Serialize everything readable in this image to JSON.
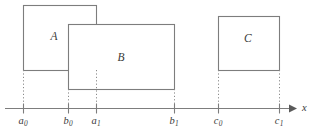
{
  "figure": {
    "width": 314,
    "height": 138,
    "background_color": "#ffffff",
    "stroke_color": "#7d7d7d",
    "text_color": "#3a3a3a",
    "dotted_color": "#8a8a8a"
  },
  "axis": {
    "name": "x",
    "y": 108,
    "start_x": 5,
    "end_x": 297,
    "name_x": 302,
    "tick_height": 5,
    "arrow": "right-arrow-head"
  },
  "ticks": [
    {
      "id": "a0",
      "letter": "a",
      "subscript": "0",
      "x": 23
    },
    {
      "id": "b0",
      "letter": "b",
      "subscript": "0",
      "x": 68
    },
    {
      "id": "a1",
      "letter": "a",
      "subscript": "1",
      "x": 96
    },
    {
      "id": "b1",
      "letter": "b",
      "subscript": "1",
      "x": 174
    },
    {
      "id": "c0",
      "letter": "c",
      "subscript": "0",
      "x": 218
    },
    {
      "id": "c1",
      "letter": "c",
      "subscript": "1",
      "x": 279
    }
  ],
  "tick_label_y": 116,
  "rectangles": [
    {
      "id": "A",
      "label": "A",
      "x0": 23,
      "x1": 96,
      "y0": 5,
      "y1": 70,
      "label_x": 54,
      "label_y": 37,
      "start_tick": "a0",
      "end_tick": "a1"
    },
    {
      "id": "B",
      "label": "B",
      "x0": 68,
      "x1": 174,
      "y0": 24,
      "y1": 89,
      "label_x": 121,
      "label_y": 58,
      "start_tick": "b0",
      "end_tick": "b1"
    },
    {
      "id": "C",
      "label": "C",
      "x0": 218,
      "x1": 279,
      "y0": 16,
      "y1": 70,
      "label_x": 248,
      "label_y": 39,
      "start_tick": "c0",
      "end_tick": "c1"
    }
  ],
  "drop_lines": [
    {
      "id": "drop-a0",
      "x": 23,
      "y_top": 70,
      "y_bottom": 108
    },
    {
      "id": "drop-a1",
      "x": 96,
      "y_top": 70,
      "y_bottom": 108
    },
    {
      "id": "drop-b0",
      "x": 68,
      "y_top": 89,
      "y_bottom": 108
    },
    {
      "id": "drop-b1",
      "x": 174,
      "y_top": 89,
      "y_bottom": 108
    },
    {
      "id": "drop-c0",
      "x": 218,
      "y_top": 70,
      "y_bottom": 108
    },
    {
      "id": "drop-c1",
      "x": 279,
      "y_top": 70,
      "y_bottom": 108
    }
  ]
}
